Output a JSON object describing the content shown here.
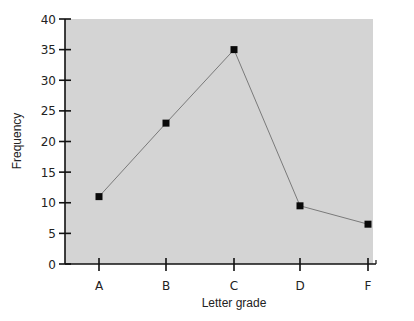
{
  "chart_data": {
    "type": "line",
    "title": "",
    "xlabel": "Letter grade",
    "ylabel": "Frequency",
    "categories": [
      "A",
      "B",
      "C",
      "D",
      "F"
    ],
    "series": [
      {
        "name": "Frequency",
        "values": [
          11,
          23,
          35,
          9.5,
          6.5
        ],
        "marker": "square"
      }
    ],
    "ylim": [
      0,
      40
    ],
    "yticks": [
      0,
      5,
      10,
      15,
      20,
      25,
      30,
      35,
      40
    ],
    "grid": false,
    "legend": null,
    "colors": {
      "plot_background": "#d4d4d4",
      "line": "#7a7a7a",
      "marker": "#0a0a0a",
      "axis": "#111111"
    }
  }
}
